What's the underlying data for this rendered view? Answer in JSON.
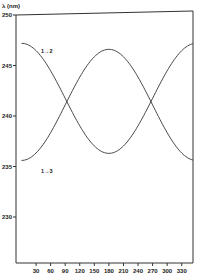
{
  "chart_data": {
    "type": "line",
    "title": "",
    "ylabel": "λ (nm)",
    "xlabel": "",
    "ylim": [
      225,
      250
    ],
    "xlim": [
      0,
      360
    ],
    "yticks": [
      230,
      235,
      240,
      245,
      250
    ],
    "ytick_labels": [
      "230",
      "235",
      "240",
      "245",
      "250"
    ],
    "xticks": [
      30,
      60,
      90,
      120,
      150,
      180,
      210,
      240,
      270,
      300,
      330
    ],
    "xtick_labels": [
      "30",
      "60",
      "90",
      "120",
      "150",
      "180",
      "210",
      "240",
      "270",
      "300",
      "330"
    ],
    "grid": false,
    "legend": "inline annotations",
    "series": [
      {
        "name": "1→2",
        "x": [
          0,
          30,
          60,
          90,
          120,
          150,
          180,
          210,
          240,
          270,
          300,
          330,
          360
        ],
        "values": [
          247.2,
          246.5,
          244.5,
          241.8,
          239.1,
          237.1,
          236.3,
          237.1,
          239.1,
          241.8,
          244.5,
          246.5,
          247.2
        ]
      },
      {
        "name": "1→3",
        "x": [
          0,
          30,
          60,
          90,
          120,
          150,
          180,
          210,
          240,
          270,
          300,
          330,
          360
        ],
        "values": [
          235.6,
          236.3,
          238.3,
          241.1,
          243.9,
          245.9,
          246.6,
          245.9,
          243.9,
          241.1,
          238.3,
          236.3,
          235.6
        ]
      }
    ],
    "annotations": [
      {
        "text": "1→2",
        "x": 40,
        "y": 246.2
      },
      {
        "text": "1→3",
        "x": 40,
        "y": 234.4
      }
    ]
  }
}
